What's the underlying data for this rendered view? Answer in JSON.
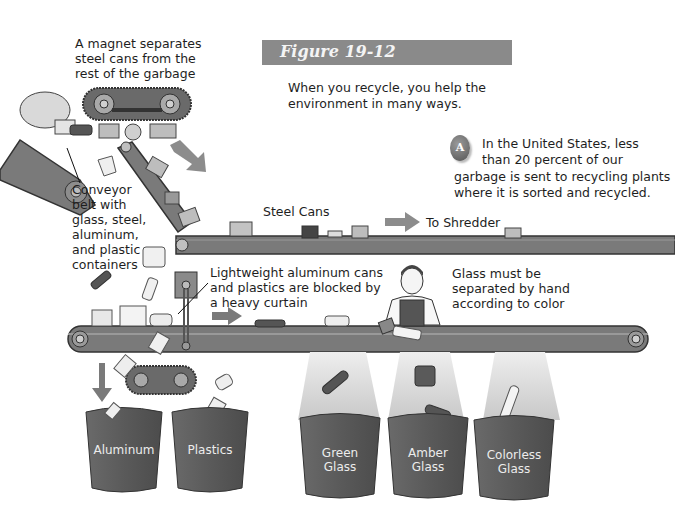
{
  "figure": {
    "title": "Figure 19-12",
    "caption": "When you recycle, you help the environment in many ways.",
    "caption_lines": [
      "When you recycle, you help the",
      "environment in many ways."
    ],
    "banner_color": "#8a8a8a"
  },
  "callout_a": {
    "badge": "A",
    "lines": [
      "In the United States, less",
      "than 20 percent of our",
      "garbage is sent to recycling plants",
      "where it is sorted and recycled."
    ]
  },
  "labels": {
    "magnet": [
      "A magnet separates",
      "steel cans from the",
      "rest of the garbage"
    ],
    "conveyor": [
      "Conveyor",
      "belt with",
      "glass, steel,",
      "aluminum,",
      "and plastic",
      "containers"
    ],
    "steel_cans": "Steel Cans",
    "to_shredder": "To Shredder",
    "curtain": [
      "Lightweight aluminum cans",
      "and plastics are blocked by",
      "a heavy curtain"
    ],
    "glass_hand": [
      "Glass must be",
      "separated by hand",
      "according to color"
    ]
  },
  "bins": [
    {
      "lines": [
        "Aluminum"
      ]
    },
    {
      "lines": [
        "Plastics"
      ]
    },
    {
      "lines": [
        "Green",
        "Glass"
      ]
    },
    {
      "lines": [
        "Amber",
        "Glass"
      ]
    },
    {
      "lines": [
        "Colorless",
        "Glass"
      ]
    }
  ],
  "colors": {
    "belt": "#7a7a7a",
    "belt_dark": "#555555",
    "bin": "#5e5e5e",
    "arrow": "#8c8c8c",
    "chute": "#d8d8d8"
  }
}
